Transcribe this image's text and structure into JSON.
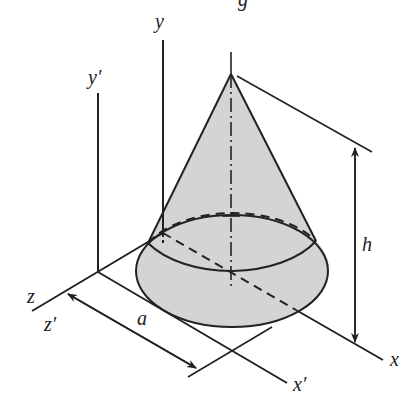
{
  "figure": {
    "title_fragment": "g",
    "labels": {
      "y": "y",
      "y_prime": "y′",
      "z": "z",
      "z_prime": "z′",
      "x": "x",
      "x_prime": "x′",
      "a": "a",
      "h": "h"
    },
    "colors": {
      "line": "#222222",
      "cone_fill": "#d4d4d4",
      "background": "#ffffff"
    }
  }
}
